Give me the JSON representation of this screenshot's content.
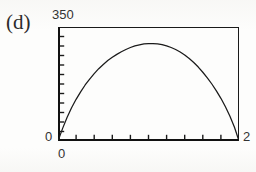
{
  "figure": {
    "panel_label": "(d)",
    "background_color": "#fdfdfc",
    "ink_color": "#1a1a1a"
  },
  "axes": {
    "y_max_label": "350",
    "y_min_label": "0",
    "x_min_label": "0",
    "x_max_label": "2",
    "y_tick_count": 11,
    "x_tick_count": 9,
    "tick_direction": "inward",
    "frame": "box"
  },
  "chart_data": {
    "type": "line",
    "title": "(d)",
    "xlabel": "",
    "ylabel": "",
    "xlim": [
      0,
      2
    ],
    "ylim": [
      0,
      350
    ],
    "xticks": [
      0,
      2
    ],
    "yticks": [
      0,
      350
    ],
    "xticklabels": [
      "0",
      "2"
    ],
    "yticklabels": [
      "0",
      "350"
    ],
    "grid": false,
    "legend": false,
    "series": [
      {
        "name": "curve-d",
        "x": [
          0.0,
          0.05,
          0.1,
          0.15,
          0.2,
          0.25,
          0.3,
          0.35,
          0.4,
          0.45,
          0.5,
          0.55,
          0.6,
          0.65,
          0.7,
          0.75,
          0.8,
          0.85,
          0.9,
          0.95,
          1.0,
          1.05,
          1.1,
          1.15,
          1.2,
          1.25,
          1.3,
          1.35,
          1.4,
          1.45,
          1.5,
          1.55,
          1.6,
          1.65,
          1.7,
          1.75,
          1.8,
          1.85,
          1.9,
          1.95,
          2.0
        ],
        "y": [
          0,
          38,
          72,
          102,
          128,
          151,
          172,
          190,
          207,
          222,
          235,
          247,
          257,
          266,
          274,
          281,
          287,
          292,
          295,
          298,
          299,
          299,
          298,
          296,
          292,
          287,
          281,
          273,
          264,
          253,
          241,
          227,
          211,
          194,
          175,
          154,
          131,
          105,
          76,
          42,
          0
        ]
      }
    ]
  }
}
